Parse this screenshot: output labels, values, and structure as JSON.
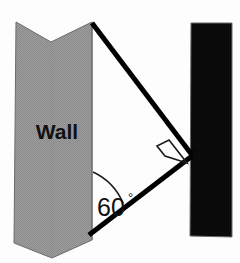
{
  "diagram": {
    "background_color": "#fdfdfd",
    "wall": {
      "label": "Wall",
      "fill_color": "#9a9a9a",
      "pattern_color": "#8a8a8a",
      "outline_color": "#5a5a5a",
      "label_color": "#111111"
    },
    "pole": {
      "name": "black-bar",
      "fill_color": "#0a0a0a",
      "outline_color": "#5a5a5a"
    },
    "ladder": {
      "stroke_color": "#000000",
      "stroke_width": "5"
    },
    "angle": {
      "value": "60",
      "degree_symbol": "°",
      "full_label": "60°",
      "arc_color": "#1a1a1a"
    },
    "right_angle": {
      "name": "right-angle-marker",
      "symbol_color": "#1a1a1a",
      "measure": "90°"
    }
  }
}
